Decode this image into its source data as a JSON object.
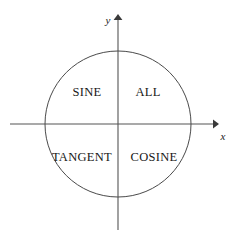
{
  "diagram": {
    "kind": "cast-quadrant-diagram",
    "background_color": "#ffffff",
    "line_color": "#555555",
    "circle_color": "#4a4a4a",
    "text_color": "#171717",
    "axes": {
      "x_axis_label": "x",
      "y_axis_label": "y",
      "origin": {
        "x": 118,
        "y": 124
      },
      "x_start": {
        "x": 10,
        "y": 124
      },
      "x_end": {
        "x": 219,
        "y": 124
      },
      "y_start": {
        "x": 118,
        "y": 230
      },
      "y_end": {
        "x": 118,
        "y": 14
      },
      "x_label_pos": {
        "x": 223,
        "y": 136
      },
      "y_label_pos": {
        "x": 108,
        "y": 22
      }
    },
    "circle": {
      "center_x": 118,
      "center_y": 124,
      "radius": 73
    },
    "quadrants": [
      {
        "id": "quadrant-1",
        "label": "ALL",
        "position": "upper-right",
        "x": 148,
        "y": 96
      },
      {
        "id": "quadrant-2",
        "label": "SINE",
        "position": "upper-left",
        "x": 87,
        "y": 96
      },
      {
        "id": "quadrant-3",
        "label": "TANGENT",
        "position": "lower-left",
        "x": 82,
        "y": 161
      },
      {
        "id": "quadrant-4",
        "label": "COSINE",
        "position": "lower-right",
        "x": 154,
        "y": 161
      }
    ]
  }
}
